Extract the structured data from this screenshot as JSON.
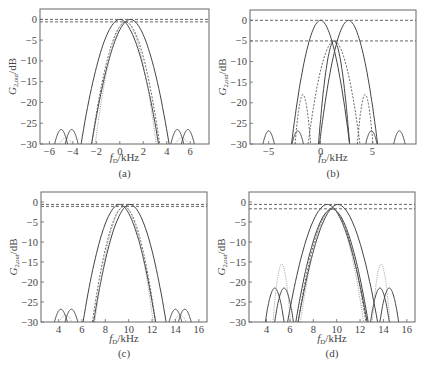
{
  "figure": {
    "panels": [
      {
        "id": "a",
        "caption": "(a)"
      },
      {
        "id": "b",
        "caption": "(b)"
      },
      {
        "id": "c",
        "caption": "(c)"
      },
      {
        "id": "d",
        "caption": "(d)"
      }
    ]
  },
  "chart_data": [
    {
      "type": "line",
      "panel": "(a)",
      "title": "",
      "xlabel": "f_D/kHz",
      "ylabel": "G_2,out/dB",
      "xlim": [
        -6.8,
        7.6
      ],
      "ylim": [
        -30,
        2.5
      ],
      "xticks": [
        -6,
        -4,
        -2,
        0,
        2,
        4,
        6
      ],
      "yticks": [
        0,
        -5,
        -10,
        -15,
        -20,
        -25,
        -30
      ],
      "grid": false,
      "reference_lines_dB": [
        0,
        -0.6
      ],
      "series": [
        {
          "name": "main lobe 1",
          "style": "solid",
          "center_kHz": 0.0,
          "peak_dB": 0,
          "null_half_width_kHz": 3.3
        },
        {
          "name": "main lobe 2",
          "style": "solid",
          "center_kHz": 0.9,
          "peak_dB": 0,
          "null_half_width_kHz": 3.3
        },
        {
          "name": "main lobe 3",
          "style": "dashed",
          "center_kHz": 0.5,
          "peak_dB": -0.6,
          "null_half_width_kHz": 2.9
        },
        {
          "name": "main lobe 4",
          "style": "dotted",
          "center_kHz": 0.5,
          "peak_dB": -0.6,
          "null_half_width_kHz": 2.6
        },
        {
          "name": "sidelobes",
          "style": "solid",
          "centers_kHz": [
            -5.0,
            -4.1,
            4.9,
            5.8
          ],
          "peak_dB": -26.5
        },
        {
          "name": "minor sidelobes",
          "style": "dotted",
          "centers_kHz": [
            -4.6,
            5.3
          ],
          "peak_dB": -28.5
        }
      ]
    },
    {
      "type": "line",
      "panel": "(b)",
      "title": "",
      "xlabel": "f_D/kHz",
      "ylabel": "G_2,out/dB",
      "xlim": [
        -6.8,
        9.2
      ],
      "ylim": [
        -30,
        2.5
      ],
      "xticks": [
        -5,
        0,
        5
      ],
      "yticks": [
        0,
        -5,
        -10,
        -15,
        -20,
        -25,
        -30
      ],
      "grid": false,
      "reference_lines_dB": [
        0,
        -5
      ],
      "series": [
        {
          "name": "main lobe 1",
          "style": "solid",
          "center_kHz": 0.0,
          "peak_dB": 0,
          "null_half_width_kHz": 2.8
        },
        {
          "name": "main lobe 2",
          "style": "solid",
          "center_kHz": 2.7,
          "peak_dB": 0,
          "null_half_width_kHz": 2.8
        },
        {
          "name": "main lobe 3",
          "style": "solid",
          "center_kHz": 1.3,
          "peak_dB": -5,
          "null_half_width_kHz": 1.5
        },
        {
          "name": "main lobe 4",
          "style": "dashed",
          "center_kHz": 1.3,
          "peak_dB": -5,
          "null_half_width_kHz": 2.5
        },
        {
          "name": "sidelobes",
          "style": "solid",
          "centers_kHz": [
            -5.0,
            -2.2,
            4.9,
            7.6
          ],
          "peak_dB": -26.8
        },
        {
          "name": "dashed sidelobes",
          "style": "dashed",
          "centers_kHz": [
            -1.7,
            4.3
          ],
          "peak_dB": -18
        }
      ]
    },
    {
      "type": "line",
      "panel": "(c)",
      "title": "",
      "xlabel": "f_D/kHz",
      "ylabel": "G_2,out/dB",
      "xlim": [
        2.5,
        16.7
      ],
      "ylim": [
        -30,
        2.5
      ],
      "xticks": [
        4,
        6,
        8,
        10,
        12,
        14,
        16
      ],
      "yticks": [
        0,
        -5,
        -10,
        -15,
        -20,
        -25,
        -30
      ],
      "grid": false,
      "reference_lines_dB": [
        -0.6,
        -1.1
      ],
      "series": [
        {
          "name": "main lobe 1",
          "style": "solid",
          "center_kHz": 9.2,
          "peak_dB": -0.6,
          "null_half_width_kHz": 3.1
        },
        {
          "name": "main lobe 2",
          "style": "solid",
          "center_kHz": 10.1,
          "peak_dB": -0.6,
          "null_half_width_kHz": 3.1
        },
        {
          "name": "main lobe 3",
          "style": "dashed",
          "center_kHz": 9.6,
          "peak_dB": -1.1,
          "null_half_width_kHz": 2.7
        },
        {
          "name": "main lobe 4",
          "style": "dotted",
          "center_kHz": 9.6,
          "peak_dB": -1.1,
          "null_half_width_kHz": 2.5
        },
        {
          "name": "sidelobes",
          "style": "solid",
          "centers_kHz": [
            4.2,
            5.1,
            14.0,
            14.8
          ],
          "peak_dB": -26.8
        },
        {
          "name": "minor sidelobes",
          "style": "dotted",
          "centers_kHz": [
            4.6,
            14.4
          ],
          "peak_dB": -28.3
        }
      ]
    },
    {
      "type": "line",
      "panel": "(d)",
      "title": "",
      "xlabel": "f_D/kHz",
      "ylabel": "G_2,out/dB",
      "xlim": [
        2.5,
        16.7
      ],
      "ylim": [
        -30,
        2.5
      ],
      "xticks": [
        4,
        6,
        8,
        10,
        12,
        14,
        16
      ],
      "yticks": [
        0,
        -5,
        -10,
        -15,
        -20,
        -25,
        -30
      ],
      "grid": false,
      "reference_lines_dB": [
        -0.6,
        -1.7
      ],
      "series": [
        {
          "name": "main lobe 1",
          "style": "solid",
          "center_kHz": 9.2,
          "peak_dB": -0.6,
          "null_half_width_kHz": 3.4
        },
        {
          "name": "main lobe 2",
          "style": "solid",
          "center_kHz": 10.1,
          "peak_dB": -0.6,
          "null_half_width_kHz": 3.4
        },
        {
          "name": "main lobe 3",
          "style": "solid",
          "center_kHz": 9.6,
          "peak_dB": -1.7,
          "null_half_width_kHz": 3.1
        },
        {
          "name": "main lobe 4",
          "style": "dashed",
          "center_kHz": 9.6,
          "peak_dB": -1.7,
          "null_half_width_kHz": 2.9
        },
        {
          "name": "main lobe 5",
          "style": "dotted",
          "center_kHz": 9.6,
          "peak_dB": -1.7,
          "null_half_width_kHz": 2.7
        },
        {
          "name": "sidelobes solid",
          "style": "solid",
          "centers_kHz": [
            4.7,
            5.5,
            13.7,
            14.5
          ],
          "peak_dB": -21.5
        },
        {
          "name": "sidelobes dotted",
          "style": "dotted",
          "centers_kHz": [
            5.3,
            13.8
          ],
          "peak_dB": -15.5
        }
      ]
    }
  ]
}
